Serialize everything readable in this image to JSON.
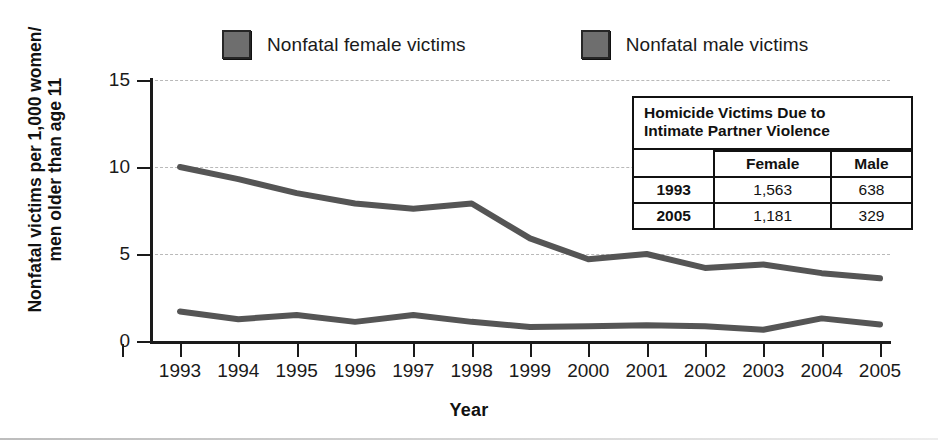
{
  "legend": {
    "items": [
      {
        "label": "Nonfatal female victims",
        "color": "#6e6e6e",
        "series": "female"
      },
      {
        "label": "Nonfatal male victims",
        "color": "#6e6e6e",
        "series": "male"
      }
    ]
  },
  "axes": {
    "y_title_line1": "Nonfatal victims per 1,000 women/",
    "y_title_line2": "men older than age 11",
    "x_title": "Year",
    "y_ticks": [
      "0",
      "5",
      "10",
      "15"
    ],
    "x_ticks": [
      "1993",
      "1994",
      "1995",
      "1996",
      "1997",
      "1998",
      "1999",
      "2000",
      "2001",
      "2002",
      "2003",
      "2004",
      "2005"
    ]
  },
  "inset_table": {
    "title_line1": "Homicide Victims Due to",
    "title_line2": "Intimate Partner Violence",
    "corner": "",
    "headers": [
      "Female",
      "Male"
    ],
    "rows": [
      {
        "year": "1993",
        "female": "1,563",
        "male": "638"
      },
      {
        "year": "2005",
        "female": "1,181",
        "male": "329"
      }
    ]
  },
  "chart_data": {
    "type": "line",
    "title": "",
    "xlabel": "Year",
    "ylabel": "Nonfatal victims per 1,000 women/men older than age 11",
    "categories": [
      "1993",
      "1994",
      "1995",
      "1996",
      "1997",
      "1998",
      "1999",
      "2000",
      "2001",
      "2002",
      "2003",
      "2004",
      "2005"
    ],
    "series": [
      {
        "name": "Nonfatal female victims",
        "color": "#555555",
        "values": [
          10.0,
          9.3,
          8.5,
          7.9,
          7.6,
          7.9,
          5.9,
          4.7,
          5.0,
          4.2,
          4.4,
          3.9,
          3.6
        ]
      },
      {
        "name": "Nonfatal male victims",
        "color": "#555555",
        "values": [
          1.7,
          1.25,
          1.5,
          1.1,
          1.5,
          1.1,
          0.8,
          0.85,
          0.9,
          0.85,
          0.65,
          1.3,
          0.95
        ]
      }
    ],
    "ylim": [
      0,
      15
    ],
    "ytick_values": [
      0,
      5,
      10,
      15
    ],
    "grid": "horizontal-dashed",
    "legend_position": "top",
    "annotations": [
      {
        "type": "table",
        "title": "Homicide Victims Due to Intimate Partner Violence",
        "columns": [
          "",
          "Female",
          "Male"
        ],
        "rows": [
          [
            "1993",
            "1,563",
            "638"
          ],
          [
            "2005",
            "1,181",
            "329"
          ]
        ]
      }
    ]
  },
  "colors": {
    "line": "#555555",
    "axis": "#1a1a1a",
    "grid": "#b9b9b9",
    "swatch": "#6e6e6e",
    "background": "#ffffff"
  }
}
